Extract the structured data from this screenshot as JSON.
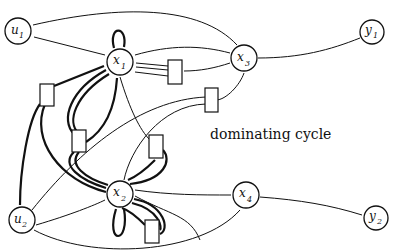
{
  "diagram": {
    "caption": "dominating cycle",
    "nodes": [
      {
        "id": "u1",
        "base": "u",
        "sub": "1",
        "x": 18,
        "y": 31
      },
      {
        "id": "x1",
        "base": "x",
        "sub": "1",
        "x": 120,
        "y": 62
      },
      {
        "id": "x3",
        "base": "x",
        "sub": "3",
        "x": 244,
        "y": 58
      },
      {
        "id": "y1",
        "base": "y",
        "sub": "1",
        "x": 372,
        "y": 32
      },
      {
        "id": "u2",
        "base": "u",
        "sub": "2",
        "x": 22,
        "y": 220
      },
      {
        "id": "x2",
        "base": "x",
        "sub": "2",
        "x": 120,
        "y": 194
      },
      {
        "id": "x4",
        "base": "x",
        "sub": "4",
        "x": 246,
        "y": 195
      },
      {
        "id": "y2",
        "base": "y",
        "sub": "2",
        "x": 376,
        "y": 218
      }
    ],
    "labels": {
      "u1_base": "u",
      "u1_sub": "1",
      "x1_base": "x",
      "x1_sub": "1",
      "x3_base": "x",
      "x3_sub": "3",
      "y1_base": "y",
      "y1_sub": "1",
      "u2_base": "u",
      "u2_sub": "2",
      "x2_base": "x",
      "x2_sub": "2",
      "x4_base": "x",
      "x4_sub": "4",
      "y2_base": "y",
      "y2_sub": "2"
    }
  }
}
